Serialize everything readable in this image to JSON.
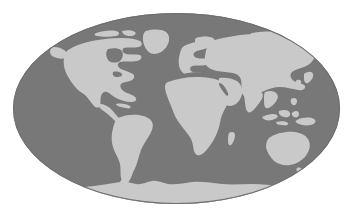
{
  "figure": {
    "name": "world-map-mollweide",
    "background_color": "#ffffff"
  },
  "projection": {
    "type": "mollweide",
    "shape": "ellipse",
    "center_x": 176.5,
    "center_y": 108.5,
    "radius_x": 163.5,
    "radius_y": 95.5
  },
  "colors": {
    "ocean": "#787878",
    "land": "#c9c9c9",
    "background": "#ffffff",
    "ocean_edge": "#6f6f6f"
  },
  "landmasses": [
    {
      "id": "north-america",
      "label": "North America"
    },
    {
      "id": "greenland",
      "label": "Greenland"
    },
    {
      "id": "south-america",
      "label": "South America"
    },
    {
      "id": "africa",
      "label": "Africa"
    },
    {
      "id": "europe",
      "label": "Europe"
    },
    {
      "id": "asia",
      "label": "Asia"
    },
    {
      "id": "middle-east",
      "label": "Middle East"
    },
    {
      "id": "india",
      "label": "India"
    },
    {
      "id": "southeast-asia",
      "label": "Southeast Asia"
    },
    {
      "id": "japan",
      "label": "Japan"
    },
    {
      "id": "australia",
      "label": "Australia"
    },
    {
      "id": "new-guinea",
      "label": "New Guinea"
    },
    {
      "id": "new-zealand",
      "label": "New Zealand"
    },
    {
      "id": "antarctica",
      "label": "Antarctica"
    },
    {
      "id": "madagascar",
      "label": "Madagascar"
    },
    {
      "id": "british-isles",
      "label": "British Isles"
    },
    {
      "id": "caribbean",
      "label": "Caribbean"
    },
    {
      "id": "arctic-islands",
      "label": "Arctic Islands"
    }
  ],
  "chart_data": {
    "type": "map",
    "projection": "Mollweide (elliptical)",
    "legend": [
      {
        "label": "Land",
        "color": "#c9c9c9"
      },
      {
        "label": "Ocean",
        "color": "#787878"
      }
    ],
    "xlabel": "",
    "ylabel": "",
    "grid": false
  }
}
